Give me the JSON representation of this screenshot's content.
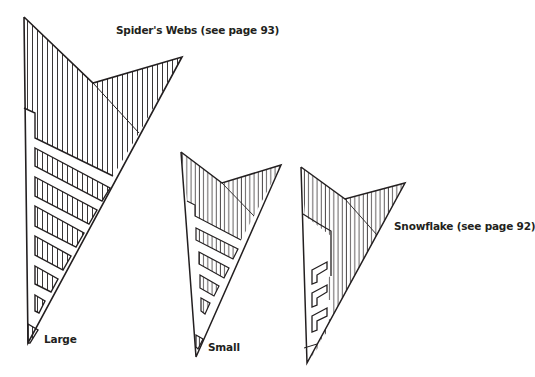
{
  "labels": {
    "spiders_webs": "Spider's Webs (see page 93)",
    "large": "Large",
    "small": "Small",
    "snowflake": "Snowflake (see page 92)"
  },
  "figures": [
    {
      "name": "Large",
      "caption_ref": "Spider's Webs (see page 93)",
      "cut_strips": 7
    },
    {
      "name": "Small",
      "caption_ref": "Spider's Webs (see page 93)",
      "cut_strips": 5
    },
    {
      "name": "Snowflake",
      "caption_ref": "Snowflake (see page 92)",
      "cut_notches": 3
    }
  ],
  "colors": {
    "ink": "#231f20",
    "paper": "#ffffff"
  }
}
